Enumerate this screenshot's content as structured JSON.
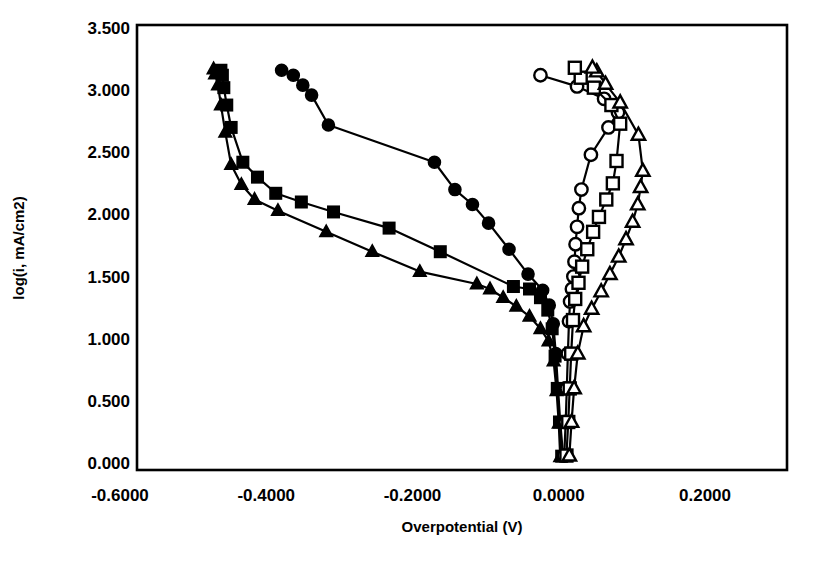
{
  "chart_data": {
    "type": "scatter",
    "title": "",
    "xlabel": "Overpotential (V)",
    "ylabel": "log(i, mA/cm2)",
    "xlim": [
      -0.6,
      0.2
    ],
    "ylim": [
      0.0,
      3.5
    ],
    "xticks": [
      "-0.6000",
      "-0.4000",
      "-0.2000",
      "0.0000",
      "0.2000"
    ],
    "xtick_values": [
      -0.6,
      -0.4,
      -0.2,
      0.0,
      0.2
    ],
    "yticks": [
      "0.000",
      "0.500",
      "1.000",
      "1.500",
      "2.000",
      "2.500",
      "3.000",
      "3.500"
    ],
    "ytick_values": [
      0.0,
      0.5,
      1.0,
      1.5,
      2.0,
      2.5,
      3.0,
      3.5
    ],
    "grid": false,
    "legend": "none",
    "series": [
      {
        "name": "cathodic-filled-circles",
        "marker": "filled-circle",
        "points": [
          [
            0.006,
            0.06
          ],
          [
            0.002,
            0.33
          ],
          [
            -0.001,
            0.6
          ],
          [
            -0.004,
            0.88
          ],
          [
            -0.0075,
            1.12
          ],
          [
            -0.013,
            1.27
          ],
          [
            -0.022,
            1.39
          ],
          [
            -0.042,
            1.52
          ],
          [
            -0.068,
            1.72
          ],
          [
            -0.096,
            1.93
          ],
          [
            -0.118,
            2.08
          ],
          [
            -0.142,
            2.2
          ],
          [
            -0.17,
            2.42
          ],
          [
            -0.315,
            2.72
          ],
          [
            -0.338,
            2.96
          ],
          [
            -0.35,
            3.04
          ],
          [
            -0.363,
            3.12
          ],
          [
            -0.379,
            3.16
          ]
        ]
      },
      {
        "name": "cathodic-filled-squares",
        "marker": "filled-square",
        "points": [
          [
            0.004,
            0.055
          ],
          [
            0.001,
            0.33
          ],
          [
            -0.002,
            0.6
          ],
          [
            -0.005,
            0.86
          ],
          [
            -0.009,
            1.08
          ],
          [
            -0.015,
            1.23
          ],
          [
            -0.025,
            1.33
          ],
          [
            -0.04,
            1.4
          ],
          [
            -0.062,
            1.42
          ],
          [
            -0.162,
            1.7
          ],
          [
            -0.232,
            1.89
          ],
          [
            -0.308,
            2.02
          ],
          [
            -0.352,
            2.1
          ],
          [
            -0.387,
            2.17
          ],
          [
            -0.412,
            2.3
          ],
          [
            -0.432,
            2.42
          ],
          [
            -0.448,
            2.7
          ],
          [
            -0.454,
            2.88
          ],
          [
            -0.458,
            3.02
          ],
          [
            -0.46,
            3.12
          ],
          [
            -0.462,
            3.16
          ]
        ]
      },
      {
        "name": "cathodic-filled-triangles",
        "marker": "filled-triangle",
        "points": [
          [
            0.002,
            0.05
          ],
          [
            0.0,
            0.32
          ],
          [
            -0.003,
            0.58
          ],
          [
            -0.007,
            0.82
          ],
          [
            -0.014,
            0.98
          ],
          [
            -0.025,
            1.08
          ],
          [
            -0.04,
            1.18
          ],
          [
            -0.058,
            1.26
          ],
          [
            -0.076,
            1.33
          ],
          [
            -0.094,
            1.4
          ],
          [
            -0.112,
            1.44
          ],
          [
            -0.19,
            1.54
          ],
          [
            -0.255,
            1.7
          ],
          [
            -0.318,
            1.86
          ],
          [
            -0.384,
            2.03
          ],
          [
            -0.416,
            2.12
          ],
          [
            -0.434,
            2.24
          ],
          [
            -0.448,
            2.4
          ],
          [
            -0.456,
            2.66
          ],
          [
            -0.462,
            2.88
          ],
          [
            -0.466,
            3.04
          ],
          [
            -0.47,
            3.13
          ],
          [
            -0.472,
            3.17
          ]
        ]
      },
      {
        "name": "anodic-open-circles",
        "marker": "open-circle",
        "points": [
          [
            0.0075,
            0.06
          ],
          [
            0.0095,
            0.33
          ],
          [
            0.011,
            0.6
          ],
          [
            0.0125,
            0.88
          ],
          [
            0.014,
            1.14
          ],
          [
            0.0155,
            1.3
          ],
          [
            0.018,
            1.4
          ],
          [
            0.02,
            1.5
          ],
          [
            0.0215,
            1.62
          ],
          [
            0.023,
            1.76
          ],
          [
            0.025,
            1.9
          ],
          [
            0.0275,
            2.05
          ],
          [
            0.031,
            2.2
          ],
          [
            0.044,
            2.48
          ],
          [
            0.068,
            2.7
          ],
          [
            0.081,
            2.82
          ],
          [
            0.062,
            2.93
          ],
          [
            0.025,
            3.03
          ],
          [
            -0.025,
            3.12
          ]
        ]
      },
      {
        "name": "anodic-open-squares",
        "marker": "open-square",
        "points": [
          [
            0.0105,
            0.06
          ],
          [
            0.013,
            0.33
          ],
          [
            0.015,
            0.6
          ],
          [
            0.017,
            0.88
          ],
          [
            0.0195,
            1.15
          ],
          [
            0.0225,
            1.32
          ],
          [
            0.027,
            1.45
          ],
          [
            0.032,
            1.58
          ],
          [
            0.039,
            1.72
          ],
          [
            0.047,
            1.86
          ],
          [
            0.055,
            1.98
          ],
          [
            0.065,
            2.12
          ],
          [
            0.074,
            2.25
          ],
          [
            0.079,
            2.43
          ],
          [
            0.084,
            2.73
          ],
          [
            0.072,
            2.88
          ],
          [
            0.048,
            3.02
          ],
          [
            0.03,
            3.1
          ],
          [
            0.022,
            3.18
          ]
        ]
      },
      {
        "name": "anodic-open-triangles",
        "marker": "open-triangle",
        "points": [
          [
            0.0145,
            0.06
          ],
          [
            0.0175,
            0.33
          ],
          [
            0.021,
            0.6
          ],
          [
            0.026,
            0.88
          ],
          [
            0.034,
            1.1
          ],
          [
            0.045,
            1.24
          ],
          [
            0.058,
            1.38
          ],
          [
            0.07,
            1.52
          ],
          [
            0.082,
            1.66
          ],
          [
            0.092,
            1.8
          ],
          [
            0.101,
            1.94
          ],
          [
            0.108,
            2.08
          ],
          [
            0.112,
            2.22
          ],
          [
            0.115,
            2.35
          ],
          [
            0.109,
            2.64
          ],
          [
            0.084,
            2.9
          ],
          [
            0.064,
            3.05
          ],
          [
            0.052,
            3.15
          ],
          [
            0.046,
            3.18
          ]
        ]
      }
    ]
  },
  "axes": {
    "x_title": "Overpotential (V)",
    "y_title": "log(i, mA/cm2)"
  }
}
